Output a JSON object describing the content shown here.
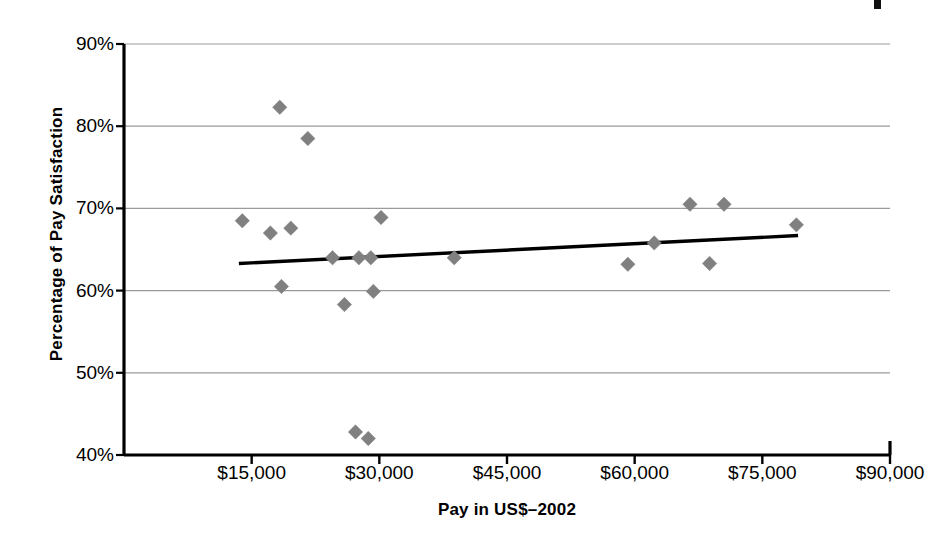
{
  "chart_data": {
    "type": "scatter",
    "title": "",
    "xlabel": "Pay in US$–2002",
    "ylabel": "Percentage of Pay Satisfaction",
    "xlim": [
      0,
      90000
    ],
    "ylim": [
      40,
      90
    ],
    "grid": true,
    "legend": false,
    "marker": "diamond",
    "marker_color": "#808080",
    "xticks": [
      15000,
      30000,
      45000,
      60000,
      75000,
      90000
    ],
    "xtick_labels": [
      "$15,000",
      "$30,000",
      "$45,000",
      "$60,000",
      "$75,000",
      "$90,000"
    ],
    "yticks": [
      40,
      50,
      60,
      70,
      80,
      90
    ],
    "ytick_labels": [
      "40%",
      "50%",
      "60%",
      "70%",
      "80%",
      "90%"
    ],
    "points": [
      {
        "x": 13900,
        "y": 68.5
      },
      {
        "x": 18300,
        "y": 82.3
      },
      {
        "x": 17200,
        "y": 67.0
      },
      {
        "x": 19600,
        "y": 67.6
      },
      {
        "x": 18500,
        "y": 60.5
      },
      {
        "x": 21600,
        "y": 78.5
      },
      {
        "x": 24500,
        "y": 64.0
      },
      {
        "x": 25900,
        "y": 58.3
      },
      {
        "x": 27600,
        "y": 64.0
      },
      {
        "x": 29000,
        "y": 64.0
      },
      {
        "x": 29300,
        "y": 59.9
      },
      {
        "x": 30200,
        "y": 68.9
      },
      {
        "x": 27200,
        "y": 42.8
      },
      {
        "x": 28700,
        "y": 42.0
      },
      {
        "x": 38800,
        "y": 64.0
      },
      {
        "x": 59200,
        "y": 63.2
      },
      {
        "x": 62300,
        "y": 65.8
      },
      {
        "x": 66500,
        "y": 70.5
      },
      {
        "x": 68800,
        "y": 63.3
      },
      {
        "x": 70500,
        "y": 70.5
      },
      {
        "x": 79000,
        "y": 68.0
      }
    ],
    "trendline": {
      "label": "linear-trend",
      "color": "#000000",
      "x_start": 13500,
      "y_start": 63.3,
      "x_end": 79200,
      "y_end": 66.7
    }
  },
  "axes": {
    "plot_left_px": 124,
    "plot_right_px": 890,
    "plot_top_px": 44,
    "plot_bottom_px": 455,
    "axis_color": "#000000",
    "grid_color": "#9a9a9a"
  }
}
